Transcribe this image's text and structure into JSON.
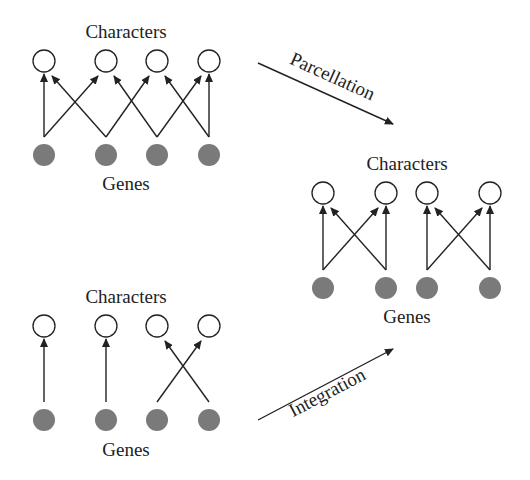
{
  "panels": {
    "top_left": {
      "characters_label": "Characters",
      "genes_label": "Genes",
      "characters_x": [
        44,
        106,
        157,
        209
      ],
      "characters_y": 61,
      "genes_x": [
        44,
        106,
        157,
        209
      ],
      "genes_y": 155,
      "edges": [
        [
          0,
          0
        ],
        [
          0,
          1
        ],
        [
          1,
          0
        ],
        [
          1,
          2
        ],
        [
          2,
          1
        ],
        [
          2,
          3
        ],
        [
          3,
          2
        ],
        [
          3,
          3
        ]
      ]
    },
    "right": {
      "characters_label": "Characters",
      "genes_label": "Genes",
      "characters_x": [
        323,
        386,
        427,
        490
      ],
      "characters_y": 193,
      "genes_x": [
        323,
        386,
        427,
        490
      ],
      "genes_y": 288,
      "edges": [
        [
          0,
          0
        ],
        [
          0,
          1
        ],
        [
          1,
          0
        ],
        [
          1,
          1
        ],
        [
          2,
          2
        ],
        [
          2,
          3
        ],
        [
          3,
          2
        ],
        [
          3,
          3
        ]
      ]
    },
    "bottom_left": {
      "characters_label": "Characters",
      "genes_label": "Genes",
      "characters_x": [
        44,
        106,
        157,
        209
      ],
      "characters_y": 326,
      "genes_x": [
        44,
        106,
        157,
        209
      ],
      "genes_y": 420,
      "edges": [
        [
          0,
          0
        ],
        [
          1,
          1
        ],
        [
          2,
          3
        ],
        [
          3,
          2
        ]
      ]
    }
  },
  "transitions": {
    "parcellation": {
      "label": "Parcellation",
      "from": [
        258,
        63
      ],
      "to": [
        393,
        124
      ]
    },
    "integration": {
      "label": "Integration",
      "from": [
        258,
        420
      ],
      "to": [
        393,
        349
      ]
    }
  },
  "colors": {
    "gene_fill": "#7a7a7a",
    "character_stroke": "#222222",
    "edge": "#222222"
  }
}
